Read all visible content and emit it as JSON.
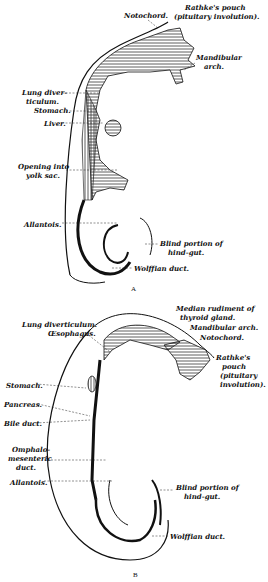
{
  "figure_a": {
    "caption": "A",
    "labels": {
      "notochord": "Notochord.",
      "rathke_1": "Rathke's pouch",
      "rathke_2": "(pituitary involution).",
      "mandibular_1": "Mandibular",
      "mandibular_2": "arch.",
      "lung_1": "Lung diver-",
      "lung_2": "ticulum.",
      "stomach": "Stomach.",
      "liver": "Liver.",
      "opening_1": "Opening into",
      "opening_2": "yolk sac.",
      "allantois": "Allantois.",
      "blind_1": "Blind portion of",
      "blind_2": "hind-gut.",
      "wolffian": "Wolffian duct."
    }
  },
  "figure_b": {
    "caption": "B",
    "labels": {
      "median_1": "Median rudiment of",
      "median_2": "thyroid gland.",
      "lung": "Lung diverticulum.",
      "oesophagus": "Œsophagus.",
      "mandibular": "Mandibular arch.",
      "notochord": "Notochord.",
      "rathke_1": "Rathke's",
      "rathke_2": "pouch",
      "rathke_3": "(pituitary",
      "rathke_4": "involution).",
      "stomach": "Stomach.",
      "pancreas": "Pancreas.",
      "bile": "Bile duct.",
      "omphalo_1": "Omphalo-",
      "omphalo_2": "mesenteric",
      "omphalo_3": "duct.",
      "allantois": "Allantois.",
      "blind_1": "Blind portion of",
      "blind_2": "hind-gut.",
      "wolffian": "Wolffian duct."
    }
  }
}
